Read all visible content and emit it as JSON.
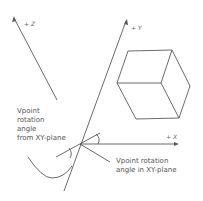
{
  "axes": {
    "z_label": "+ Z",
    "y_label": "+ Y",
    "x_label": "+ X"
  },
  "annotations": {
    "from_xy_plane": [
      "Vpoint",
      "rotation",
      "angle",
      "from XY-plane"
    ],
    "in_xy_plane": [
      "Vpoint rotation",
      "angle in XY-plane"
    ]
  },
  "colors": {
    "line": "#5a5a5a",
    "text": "#555555",
    "background": "#ffffff"
  }
}
